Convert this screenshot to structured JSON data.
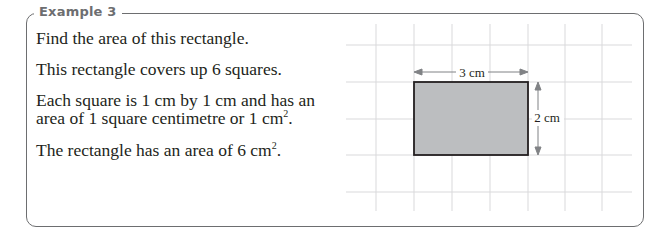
{
  "example": {
    "heading": "Example 3",
    "lines": [
      "Find the area of this rectangle.",
      "This rectangle covers up 6 squares.",
      "Each square is 1 cm by 1 cm and has an",
      "area of 1 square centimetre or 1 cm",
      "The rectangle has an area of 6 cm"
    ],
    "superscript": "2",
    "period": "."
  },
  "diagram": {
    "width_label": "3 cm",
    "height_label": "2 cm",
    "grid_color": "#d9d9db",
    "fill_color": "#bcbec0",
    "outline_color": "#231f20",
    "arrow_color": "#808285"
  }
}
